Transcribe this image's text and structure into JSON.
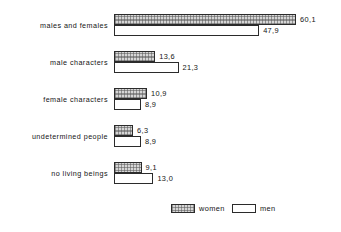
{
  "chart_data": {
    "type": "bar",
    "orientation": "horizontal",
    "title": "",
    "xlabel": "",
    "ylabel": "",
    "grid": false,
    "xlim": [
      0,
      60.1
    ],
    "axis_ticks_visible": false,
    "legend_position": "bottom-center",
    "categories": [
      "males and females",
      "male characters",
      "female characters",
      "undetermined people",
      "no living beings"
    ],
    "series": [
      {
        "name": "women",
        "style": "hatched",
        "values": [
          60.1,
          13.6,
          10.9,
          6.3,
          9.1
        ],
        "value_labels": [
          "60,1",
          "13,6",
          "10,9",
          "6,3",
          "9,1"
        ]
      },
      {
        "name": "men",
        "style": "white",
        "values": [
          47.9,
          21.3,
          8.9,
          8.9,
          13.0
        ],
        "value_labels": [
          "47,9",
          "21,3",
          "8,9",
          "8,9",
          "13,0"
        ]
      }
    ]
  },
  "legend": {
    "items": [
      {
        "label": "women"
      },
      {
        "label": "men"
      }
    ]
  },
  "colors": {
    "hatch_fill": "#d6d6d6",
    "hatch_line": "#5a5a5a",
    "bar_outline": "#2b2b2b",
    "plain_fill": "#ffffff",
    "text": "#141414",
    "background": "#ffffff"
  }
}
